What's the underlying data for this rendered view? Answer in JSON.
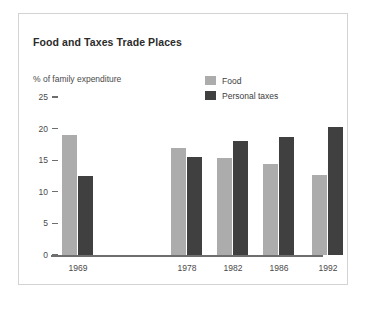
{
  "chart_title": "Food and Taxes Trade Places",
  "axis_note": "% of family expenditure",
  "legend": [
    {
      "label": "Food",
      "color": "#acacac",
      "name": "food"
    },
    {
      "label": "Personal taxes",
      "color": "#404040",
      "name": "personal-taxes"
    }
  ],
  "y_ticks": [
    "25",
    "20",
    "15",
    "10",
    "5",
    "0"
  ],
  "x_labels": [
    "1969",
    "1978",
    "1982",
    "1986",
    "1992"
  ],
  "colors": {
    "food": "#acacac",
    "personal_taxes": "#404040",
    "axis": "#6e6e6e",
    "frame": "#d3d3d3",
    "title": "#2b2b2b",
    "text": "#4a4a4a",
    "background": "#ffffff"
  },
  "chart_data": {
    "type": "bar",
    "title": "Food and Taxes Trade Places",
    "xlabel": "",
    "ylabel": "% of family expenditure",
    "categories": [
      "1969",
      "1978",
      "1982",
      "1986",
      "1992"
    ],
    "series": [
      {
        "name": "Food",
        "color": "#acacac",
        "values": [
          19.0,
          17.0,
          15.3,
          14.4,
          12.6
        ]
      },
      {
        "name": "Personal taxes",
        "color": "#404040",
        "values": [
          12.5,
          15.5,
          18.0,
          18.7,
          20.2
        ]
      }
    ],
    "ylim": [
      0,
      25
    ],
    "yticks": [
      0,
      5,
      10,
      15,
      20,
      25
    ],
    "grid": false,
    "legend_position": "top-right"
  }
}
